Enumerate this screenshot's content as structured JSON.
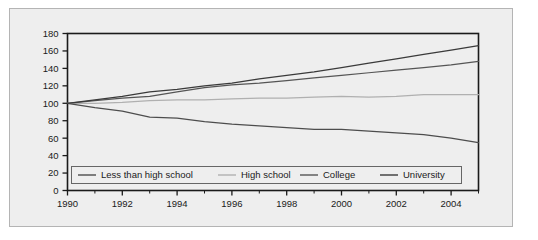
{
  "chart_data": {
    "type": "line",
    "title": "",
    "subtitle": "",
    "xlabel": "",
    "ylabel": "",
    "xlim": [
      1990,
      2005
    ],
    "ylim": [
      0,
      180
    ],
    "grid": false,
    "legend_position": "bottom-inside",
    "y_ticks": [
      0,
      20,
      40,
      60,
      80,
      100,
      120,
      140,
      160,
      180
    ],
    "y_tick_labels": [
      "0",
      "20",
      "40",
      "60",
      "80",
      "100",
      "120",
      "140",
      "160",
      "180"
    ],
    "x_ticks": [
      1990,
      1992,
      1994,
      1996,
      1998,
      2000,
      2002,
      2004
    ],
    "x_tick_labels": [
      "1990",
      "1992",
      "1994",
      "1996",
      "1998",
      "2000",
      "2002",
      "2004"
    ],
    "x_minor_ticks": [
      1991,
      1993,
      1995,
      1997,
      1999,
      2001,
      2003,
      2005
    ],
    "x": [
      1990,
      1991,
      1992,
      1993,
      1994,
      1995,
      1996,
      1997,
      1998,
      1999,
      2000,
      2001,
      2002,
      2003,
      2004,
      2005
    ],
    "series": [
      {
        "name": "Less than high school",
        "color": "#4d4d4d",
        "values": [
          100,
          95,
          91,
          84,
          83,
          79,
          76,
          74,
          72,
          70,
          70,
          68,
          66,
          64,
          60,
          55
        ]
      },
      {
        "name": "High school",
        "color": "#b0b0b0",
        "values": [
          100,
          100,
          101,
          103,
          104,
          104,
          105,
          106,
          106,
          107,
          108,
          107,
          108,
          110,
          110,
          110
        ]
      },
      {
        "name": "College",
        "color": "#555555",
        "values": [
          100,
          103,
          106,
          108,
          113,
          118,
          121,
          123,
          126,
          129,
          132,
          135,
          138,
          141,
          144,
          148
        ]
      },
      {
        "name": "University",
        "color": "#3a3a3a",
        "values": [
          100,
          104,
          108,
          113,
          116,
          120,
          123,
          128,
          132,
          136,
          141,
          146,
          151,
          156,
          161,
          166
        ]
      }
    ]
  },
  "legend": {
    "entries": [
      {
        "label": "Less than high school"
      },
      {
        "label": "High school"
      },
      {
        "label": "College"
      },
      {
        "label": "University"
      }
    ]
  },
  "colors": {
    "paper_background": "#eeeeee",
    "axis": "#1a1a1a",
    "frame": "#b4b4b4"
  }
}
